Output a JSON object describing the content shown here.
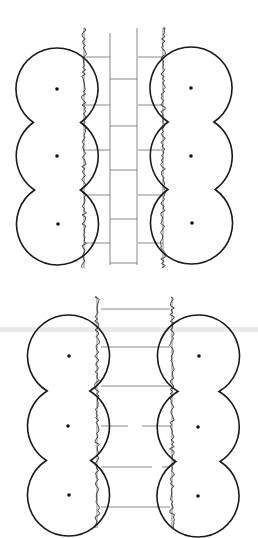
{
  "figure": {
    "colors": {
      "ink": "#1a1a1a",
      "paving": "#6a6a6a",
      "background": "#ffffff"
    }
  },
  "diagrams": [
    {
      "name": "upper-plan",
      "trees_left": [
        {
          "cx": 57,
          "cy": 89
        },
        {
          "cx": 57,
          "cy": 156
        },
        {
          "cx": 58,
          "cy": 224
        }
      ],
      "trees_right": [
        {
          "cx": 191,
          "cy": 88
        },
        {
          "cx": 191,
          "cy": 156
        },
        {
          "cx": 192,
          "cy": 223
        }
      ],
      "radius": 41,
      "hedge_left_x": 84,
      "hedge_right_x": 163,
      "hedge_y": [
        28,
        268
      ],
      "path_edges_x": [
        110,
        137
      ],
      "paving_type": "staggered"
    },
    {
      "name": "lower-plan",
      "trees_left": [
        {
          "cx": 69,
          "cy": 356
        },
        {
          "cx": 68,
          "cy": 426
        },
        {
          "cx": 69,
          "cy": 495
        }
      ],
      "trees_right": [
        {
          "cx": 199,
          "cy": 356
        },
        {
          "cx": 198,
          "cy": 427
        },
        {
          "cx": 198,
          "cy": 496
        }
      ],
      "radius": 41,
      "hedge_left_x": 97,
      "hedge_right_x": 172,
      "hedge_y": [
        297,
        528
      ],
      "paving_y": [
        309,
        347,
        386,
        426,
        467,
        507
      ],
      "paving_type": "cross-bands"
    }
  ]
}
